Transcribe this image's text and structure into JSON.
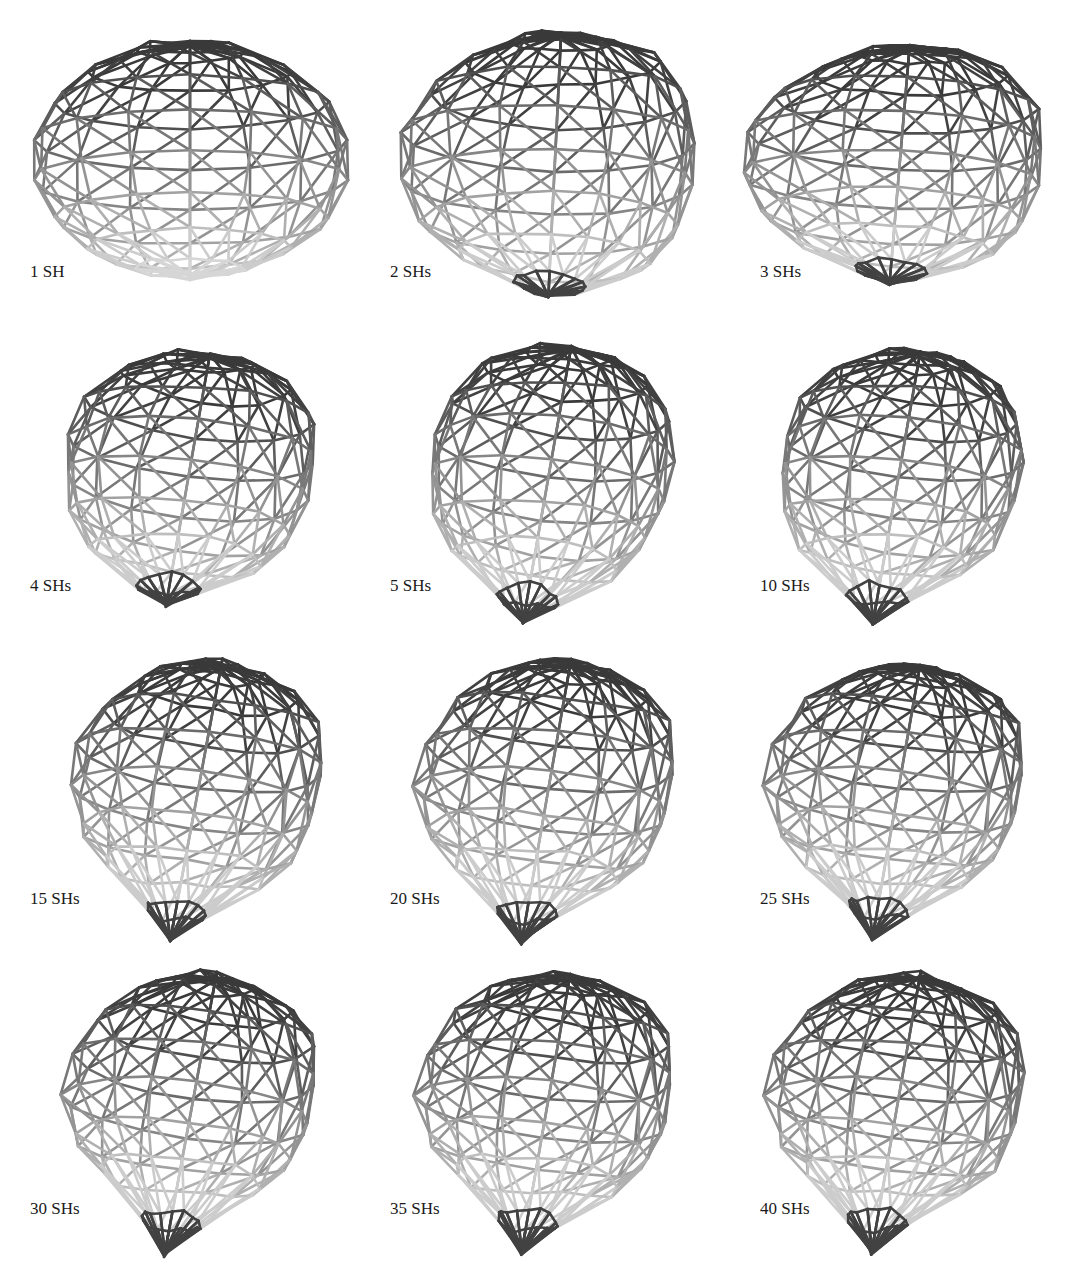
{
  "figure": {
    "type": "wireframe-mesh-grid",
    "rows": 4,
    "cols": 3,
    "stroke_dark": "#3a3a3a",
    "stroke_light": "#d6d6d6",
    "panels": [
      {
        "label": "1 SH",
        "cx": 190,
        "cy": 160,
        "rx": 160,
        "ry": 122,
        "tilt": 0,
        "tip": 0,
        "bumps": 0
      },
      {
        "label": "2 SHs",
        "cx": 555,
        "cy": 160,
        "rx": 150,
        "ry": 132,
        "tilt": 8,
        "tip": 10,
        "bumps": 1
      },
      {
        "label": "3 SHs",
        "cx": 900,
        "cy": 160,
        "rx": 155,
        "ry": 118,
        "tilt": 14,
        "tip": 10,
        "bumps": 1
      },
      {
        "label": "4 SHs",
        "cx": 190,
        "cy": 468,
        "rx": 150,
        "ry": 118,
        "tilt": 30,
        "tip": 24,
        "bumps": 2
      },
      {
        "label": "5 SHs",
        "cx": 550,
        "cy": 468,
        "rx": 145,
        "ry": 125,
        "tilt": 30,
        "tip": 34,
        "bumps": 2
      },
      {
        "label": "10 SHs",
        "cx": 900,
        "cy": 468,
        "rx": 145,
        "ry": 120,
        "tilt": 30,
        "tip": 40,
        "bumps": 2
      },
      {
        "label": "15 SHs",
        "cx": 200,
        "cy": 780,
        "rx": 145,
        "ry": 120,
        "tilt": 32,
        "tip": 46,
        "bumps": 3
      },
      {
        "label": "20 SHs",
        "cx": 550,
        "cy": 780,
        "rx": 145,
        "ry": 122,
        "tilt": 30,
        "tip": 46,
        "bumps": 3
      },
      {
        "label": "25 SHs",
        "cx": 900,
        "cy": 780,
        "rx": 145,
        "ry": 118,
        "tilt": 30,
        "tip": 46,
        "bumps": 3
      },
      {
        "label": "30 SHs",
        "cx": 195,
        "cy": 1090,
        "rx": 145,
        "ry": 118,
        "tilt": 32,
        "tip": 52,
        "bumps": 3
      },
      {
        "label": "35 SHs",
        "cx": 550,
        "cy": 1090,
        "rx": 145,
        "ry": 118,
        "tilt": 30,
        "tip": 50,
        "bumps": 3
      },
      {
        "label": "40 SHs",
        "cx": 900,
        "cy": 1090,
        "rx": 145,
        "ry": 118,
        "tilt": 30,
        "tip": 50,
        "bumps": 3
      }
    ],
    "label_positions": [
      {
        "x": 30,
        "y": 262
      },
      {
        "x": 390,
        "y": 262
      },
      {
        "x": 760,
        "y": 262
      },
      {
        "x": 30,
        "y": 576
      },
      {
        "x": 390,
        "y": 576
      },
      {
        "x": 760,
        "y": 576
      },
      {
        "x": 30,
        "y": 889
      },
      {
        "x": 390,
        "y": 889
      },
      {
        "x": 760,
        "y": 889
      },
      {
        "x": 30,
        "y": 1199
      },
      {
        "x": 390,
        "y": 1199
      },
      {
        "x": 760,
        "y": 1199
      }
    ]
  }
}
